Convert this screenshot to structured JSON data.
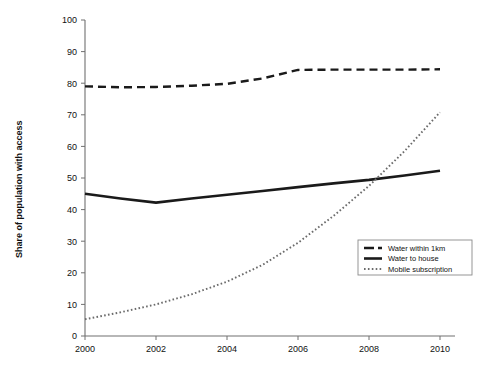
{
  "chart_data": {
    "type": "line",
    "title": "",
    "xlabel": "",
    "ylabel": "Share of population with access",
    "xlim": [
      2000,
      2010
    ],
    "ylim": [
      0,
      100
    ],
    "ytick_labels": [
      "0",
      "10",
      "20",
      "30",
      "40",
      "50",
      "60",
      "70",
      "80",
      "90",
      "100"
    ],
    "yticks": [
      0,
      10,
      20,
      30,
      40,
      50,
      60,
      70,
      80,
      90,
      100
    ],
    "xtick_labels": [
      "2000",
      "2002",
      "2004",
      "2006",
      "2008",
      "2010"
    ],
    "xticks": [
      2000,
      2002,
      2004,
      2006,
      2008,
      2010
    ],
    "grid": false,
    "legend_position": "lower-right",
    "x": [
      2000,
      2001,
      2002,
      2003,
      2004,
      2005,
      2006,
      2007,
      2008,
      2009,
      2010
    ],
    "series": [
      {
        "name": "Water within 1km",
        "style": "dashed",
        "color": "#1a1a1a",
        "values": [
          79.0,
          78.7,
          78.8,
          79.2,
          79.8,
          81.5,
          84.2,
          84.3,
          84.3,
          84.3,
          84.4
        ]
      },
      {
        "name": "Water to house",
        "style": "solid",
        "color": "#1a1a1a",
        "values": [
          45.0,
          43.5,
          42.2,
          43.5,
          44.7,
          45.9,
          47.1,
          48.3,
          49.4,
          50.8,
          52.3
        ]
      },
      {
        "name": "Mobile subscription",
        "style": "dotted",
        "color": "#6b6b6b",
        "values": [
          5.3,
          7.5,
          10.0,
          13.2,
          17.2,
          22.5,
          29.5,
          38.0,
          47.5,
          58.5,
          70.8
        ]
      }
    ]
  },
  "legend": {
    "items": [
      {
        "label": "Water within 1km",
        "swatch": "dashed-line-swatch"
      },
      {
        "label": "Water to house",
        "swatch": "solid-line-swatch"
      },
      {
        "label": "Mobile subscription",
        "swatch": "dotted-line-swatch"
      }
    ]
  },
  "axes": {
    "y_axis_title": "Share of population with access"
  }
}
